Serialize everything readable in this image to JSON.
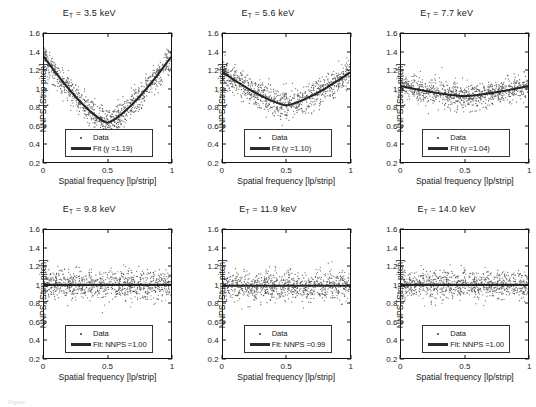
{
  "figure": {
    "caption_fragment": "Figure",
    "axis": {
      "xlabel": "Spatial frequency [lp/strip]",
      "ylabel": "NNPS [Strip pitch]",
      "xticks": [
        "0",
        "0.5",
        "1"
      ],
      "yticks": [
        "0.2",
        "0.4",
        "0.6",
        "0.8",
        "1",
        "1.2",
        "1.4",
        "1.6"
      ],
      "xlim": [
        0,
        1
      ],
      "ylim": [
        0.2,
        1.6
      ]
    },
    "legend": {
      "data_label": "Data",
      "marker_color": "#3a3a3a",
      "line_color": "#2b2b2b"
    }
  },
  "chart_data": [
    {
      "type": "scatter",
      "panel_index": 0,
      "title_prefix": "E",
      "title_sub": "T",
      "title_rest": "= 3.5 keV",
      "energy_keV": 3.5,
      "fit_label": "Fit (γ =1.19)",
      "fit_gamma": 1.19,
      "fit_type": "v-shape",
      "fit_edge_value": 1.35,
      "fit_min_value": 0.63,
      "noise_sigma": 0.075,
      "n_points": 900,
      "xlabel": "Spatial frequency [lp/strip]",
      "ylabel": "NNPS [Strip pitch]",
      "xlim": [
        0,
        1
      ],
      "ylim": [
        0.2,
        1.6
      ],
      "grid": false,
      "legend_position": "lower-center"
    },
    {
      "type": "scatter",
      "panel_index": 1,
      "title_prefix": "E",
      "title_sub": "T",
      "title_rest": "= 5.6 keV",
      "energy_keV": 5.6,
      "fit_label": "Fit (γ =1.10)",
      "fit_gamma": 1.1,
      "fit_type": "v-shape",
      "fit_edge_value": 1.18,
      "fit_min_value": 0.82,
      "noise_sigma": 0.075,
      "n_points": 900,
      "xlabel": "Spatial frequency [lp/strip]",
      "ylabel": "NNPS [Strip pitch]",
      "xlim": [
        0,
        1
      ],
      "ylim": [
        0.2,
        1.6
      ],
      "grid": false,
      "legend_position": "lower-center"
    },
    {
      "type": "scatter",
      "panel_index": 2,
      "title_prefix": "E",
      "title_sub": "T",
      "title_rest": "= 7.7 keV",
      "energy_keV": 7.7,
      "fit_label": "Fit (γ =1.04)",
      "fit_gamma": 1.04,
      "fit_type": "v-shape",
      "fit_edge_value": 1.03,
      "fit_min_value": 0.92,
      "noise_sigma": 0.072,
      "n_points": 900,
      "xlabel": "Spatial frequency [lp/strip]",
      "ylabel": "NNPS [Strip pitch]",
      "xlim": [
        0,
        1
      ],
      "ylim": [
        0.2,
        1.6
      ],
      "grid": false,
      "legend_position": "lower-center"
    },
    {
      "type": "scatter",
      "panel_index": 3,
      "title_prefix": "E",
      "title_sub": "T",
      "title_rest": "= 9.8 keV",
      "energy_keV": 9.8,
      "fit_label": "Fit: NNPS =1.00",
      "fit_value": 1.0,
      "fit_type": "flat",
      "fit_edge_value": 1.0,
      "fit_min_value": 1.0,
      "noise_sigma": 0.078,
      "n_points": 900,
      "xlabel": "Spatial frequency [lp/strip]",
      "ylabel": "NNPS [Strip pitch]",
      "xlim": [
        0,
        1
      ],
      "ylim": [
        0.2,
        1.6
      ],
      "grid": false,
      "legend_position": "lower-center"
    },
    {
      "type": "scatter",
      "panel_index": 4,
      "title_prefix": "E",
      "title_sub": "T",
      "title_rest": "= 11.9 keV",
      "energy_keV": 11.9,
      "fit_label": "Fit: NNPS =0.99",
      "fit_value": 0.99,
      "fit_type": "flat",
      "fit_edge_value": 0.99,
      "fit_min_value": 0.99,
      "noise_sigma": 0.078,
      "n_points": 900,
      "xlabel": "Spatial frequency [lp/strip]",
      "ylabel": "NNPS [Strip pitch]",
      "xlim": [
        0,
        1
      ],
      "ylim": [
        0.2,
        1.6
      ],
      "grid": false,
      "legend_position": "lower-center"
    },
    {
      "type": "scatter",
      "panel_index": 5,
      "title_prefix": "E",
      "title_sub": "T",
      "title_rest": "= 14.0 keV",
      "energy_keV": 14.0,
      "fit_label": "Fit: NNPS =1.00",
      "fit_value": 1.0,
      "fit_type": "flat",
      "fit_edge_value": 1.0,
      "fit_min_value": 1.0,
      "noise_sigma": 0.076,
      "n_points": 900,
      "xlabel": "Spatial frequency [lp/strip]",
      "ylabel": "NNPS [Strip pitch]",
      "xlim": [
        0,
        1
      ],
      "ylim": [
        0.2,
        1.6
      ],
      "grid": false,
      "legend_position": "lower-center"
    }
  ]
}
